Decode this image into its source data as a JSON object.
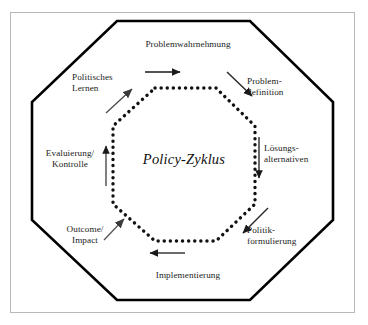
{
  "figure": {
    "center_label": "Policy-Zyklus",
    "outer_shape": "octagon",
    "inner_shape": "dotted-octagon",
    "frame_color": "#b9b9b9",
    "line_color": "#000000",
    "text_color": "#1c1c1c",
    "background": "#ffffff"
  },
  "stages": {
    "problemwahrnehmung": "Problemwahrnehmung",
    "problemdefinition": "Problem-\ndefinition",
    "loesungsalternativen": "Lösungs-\nalternativen",
    "politikformulierung": "Politik-\nformulierung",
    "implementierung": "Implementierung",
    "outcome_impact": "Outcome/\nImpact",
    "evaluierung_kontrolle": "Evaluierung/\nKontrolle",
    "politisches_lernen": "Politisches\nLernen"
  },
  "arrows": [
    {
      "name": "arrow-top-right",
      "direction": "right",
      "between": "Problemwahrnehmung -> Problemdefinition"
    },
    {
      "name": "arrow-upper-right-diagonal",
      "direction": "down-right",
      "between": "Problemdefinition"
    },
    {
      "name": "arrow-right-down",
      "direction": "down",
      "between": "Lösungsalternativen"
    },
    {
      "name": "arrow-lower-right-diagonal",
      "direction": "down-left",
      "between": "Politikformulierung"
    },
    {
      "name": "arrow-bottom-left",
      "direction": "left",
      "between": "Implementierung"
    },
    {
      "name": "arrow-lower-left-diagonal",
      "direction": "up-right",
      "between": "Outcome/Impact"
    },
    {
      "name": "arrow-left-up",
      "direction": "up",
      "between": "Evaluierung/Kontrolle"
    },
    {
      "name": "arrow-upper-left-diagonal",
      "direction": "up-right",
      "between": "Politisches Lernen"
    }
  ]
}
